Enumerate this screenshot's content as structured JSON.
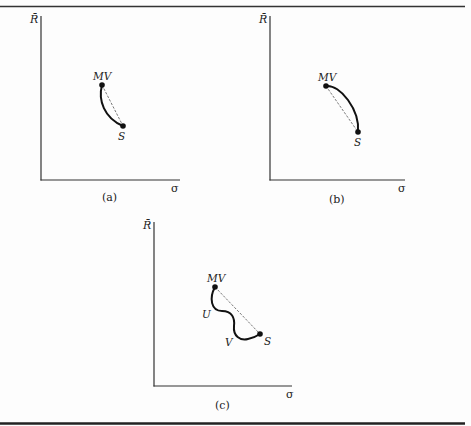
{
  "figure": {
    "panels": [
      {
        "id": "a",
        "caption": "(a)",
        "y_axis_label": "R̄",
        "x_axis_label": "σ",
        "points": [
          {
            "label": "MV",
            "x": 102,
            "y": 85
          },
          {
            "label": "S",
            "x": 123,
            "y": 126
          }
        ],
        "curve_description": "convex curve bowing left of the dashed chord"
      },
      {
        "id": "b",
        "caption": "(b)",
        "y_axis_label": "R̄",
        "x_axis_label": "σ",
        "points": [
          {
            "label": "MV",
            "x": 326,
            "y": 86
          },
          {
            "label": "S",
            "x": 358,
            "y": 132
          }
        ],
        "curve_description": "concave curve bowing right of the dashed chord"
      },
      {
        "id": "c",
        "caption": "(c)",
        "y_axis_label": "R̄",
        "x_axis_label": "σ",
        "points": [
          {
            "label": "MV",
            "x": 215,
            "y": 287
          },
          {
            "label": "S",
            "x": 260,
            "y": 334
          }
        ],
        "curve_labels": [
          "U",
          "V"
        ],
        "curve_description": "wavy curve with segments U and V below the dashed chord"
      }
    ],
    "colors": {
      "ink": "#222222",
      "background": "#fdfdfd",
      "rule": "#333333"
    }
  }
}
